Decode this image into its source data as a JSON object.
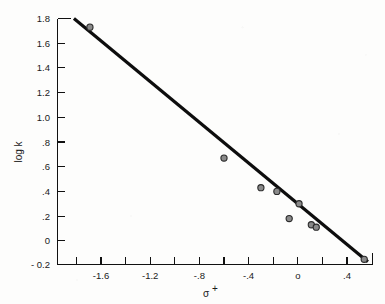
{
  "figure": {
    "background_color": "#fdfdfc",
    "ink_color": "#111111",
    "point_fill_color": "#8a8a8a",
    "point_edge_color": "#2a2a2a"
  },
  "axes": {
    "x_title": "σ",
    "x_title_superscript": "+",
    "y_title": "log k"
  },
  "chart_data": {
    "type": "scatter",
    "title": "",
    "xlabel": "σ⁺",
    "ylabel": "log k",
    "xlim": [
      -1.82,
      0.59
    ],
    "ylim": [
      -0.2,
      1.8
    ],
    "grid": false,
    "legend": false,
    "x_tick_labels": [
      "-1.6",
      "-1.2",
      "-.8",
      "-.4",
      "o",
      ".4"
    ],
    "x_tick_values": [
      -1.6,
      -1.2,
      -0.8,
      -0.4,
      0,
      0.4
    ],
    "x_minor_tick_values": [
      -1.8,
      -1.4,
      -1.0,
      -0.6,
      -0.2,
      0.2
    ],
    "y_tick_labels": [
      "1.8",
      "1.6",
      "1.4",
      "1.2",
      "1.0",
      ".8",
      ".6",
      ".4",
      ".2",
      "0",
      "- 0.2"
    ],
    "y_tick_values": [
      1.8,
      1.6,
      1.4,
      1.2,
      1.0,
      0.8,
      0.6,
      0.4,
      0.2,
      0,
      -0.2
    ],
    "series": [
      {
        "name": "observed rate constants",
        "points": [
          {
            "x": -1.69,
            "y": 1.73
          },
          {
            "x": -0.6,
            "y": 0.67
          },
          {
            "x": -0.3,
            "y": 0.43
          },
          {
            "x": -0.17,
            "y": 0.4
          },
          {
            "x": -0.07,
            "y": 0.18
          },
          {
            "x": 0.01,
            "y": 0.3
          },
          {
            "x": 0.11,
            "y": 0.13
          },
          {
            "x": 0.15,
            "y": 0.11
          },
          {
            "x": 0.54,
            "y": -0.15
          }
        ]
      }
    ],
    "fit_line": {
      "name": "least-squares fit",
      "x_start": -1.82,
      "y_start": 1.8,
      "x_end": 0.57,
      "y_end": -0.17,
      "slope": -0.82,
      "intercept": 0.3
    }
  }
}
